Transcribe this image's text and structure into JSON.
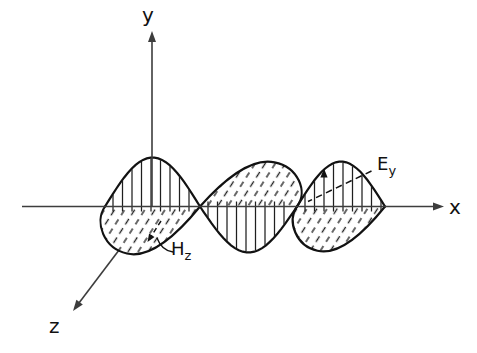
{
  "figure": {
    "labels": {
      "x_axis": "x",
      "y_axis": "y",
      "z_axis": "z",
      "e_base": "E",
      "e_sub": "y",
      "h_base": "H",
      "h_sub": "z"
    },
    "colors": {
      "background": "#ffffff",
      "curve_ink": "#121212",
      "axis_ink": "#3d3d3d",
      "hatch_ink": "#1f1f1f"
    },
    "wave": {
      "nodes": [
        105,
        200,
        297,
        385
      ],
      "axis_y": 206.5,
      "signs": [
        1,
        -1,
        1
      ],
      "e_amps": [
        49,
        46,
        45
      ],
      "v_scales": [
        1.0,
        0.94,
        0.94
      ],
      "base_span": 95,
      "h_canonical": {
        "c1": [
          -0.116,
          0.168
        ],
        "c2": [
          -0.011,
          0.442
        ],
        "tip": [
          0.232,
          0.495
        ],
        "c3": [
          0.495,
          0.558
        ],
        "c4": [
          0.811,
          0.232
        ]
      },
      "hatch": {
        "spacing": 9.5,
        "overshoot": 5
      }
    },
    "axes": {
      "x": {
        "from": [
          22,
          206.5
        ],
        "tip": [
          444,
          206.5
        ]
      },
      "y": {
        "from": [
          152,
          206.5
        ],
        "tip": [
          152,
          31
        ]
      },
      "z": {
        "from": [
          152,
          206.5
        ],
        "tip": [
          73,
          311
        ]
      }
    },
    "annotations": {
      "e_leader": {
        "from": [
          371.5,
          171
        ],
        "to": [
          308,
          201.5
        ]
      },
      "h_leader_path": "M 173 252 C 165 251 160 246 157 238",
      "e_vector_x": 324,
      "h_vector": {
        "from": [
          161,
          221
        ],
        "to": [
          147.5,
          242
        ]
      }
    }
  }
}
